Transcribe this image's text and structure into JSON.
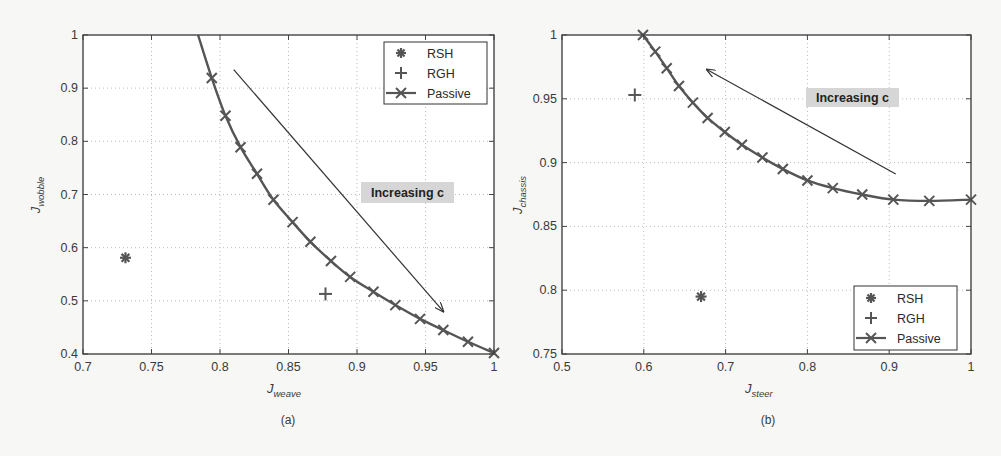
{
  "figure": {
    "panels": [
      {
        "caption": "(a)",
        "xlabel_main": "J",
        "xlabel_sub": "weave",
        "ylabel_main": "J",
        "ylabel_sub": "wobble",
        "annotation": "Increasing c",
        "legend": [
          "RSH",
          "RGH",
          "Passive"
        ]
      },
      {
        "caption": "(b)",
        "xlabel_main": "J",
        "xlabel_sub": "steer",
        "ylabel_main": "J",
        "ylabel_sub": "chassis",
        "annotation": "Increasing c",
        "legend": [
          "RSH",
          "RGH",
          "Passive"
        ]
      }
    ]
  },
  "colors": {
    "curve": "#555555",
    "axes": "#444444",
    "grid": "#bbbbbb",
    "annotation_bg": "#d6d6d6",
    "background": "#f7f7f5"
  },
  "chart_data": [
    {
      "type": "scatter",
      "title": "(a)",
      "xlabel": "J_weave",
      "ylabel": "J_wobble",
      "xlim": [
        0.7,
        1.0
      ],
      "ylim": [
        0.4,
        1.0
      ],
      "xticks": [
        0.7,
        0.75,
        0.8,
        0.85,
        0.9,
        0.95,
        1.0
      ],
      "xtick_labels": [
        "0.7",
        "0.75",
        "0.8",
        "0.85",
        "0.9",
        "0.95",
        "1"
      ],
      "yticks": [
        0.4,
        0.5,
        0.6,
        0.7,
        0.8,
        0.9,
        1.0
      ],
      "ytick_labels": [
        "0.4",
        "0.5",
        "0.6",
        "0.7",
        "0.8",
        "0.9",
        "1"
      ],
      "grid": true,
      "legend_position": "upper right",
      "annotation": {
        "text": "Increasing c",
        "arrow_from": [
          0.81,
          0.935
        ],
        "arrow_to": [
          0.963,
          0.48
        ]
      },
      "series": [
        {
          "name": "RSH",
          "marker": "asterisk",
          "x": [
            0.731
          ],
          "y": [
            0.581
          ]
        },
        {
          "name": "RGH",
          "marker": "plus",
          "x": [
            0.877
          ],
          "y": [
            0.513
          ]
        },
        {
          "name": "Passive",
          "marker": "x-line",
          "curve_start": [
            0.784,
            1.0
          ],
          "x": [
            0.794,
            0.804,
            0.815,
            0.827,
            0.839,
            0.853,
            0.866,
            0.881,
            0.895,
            0.912,
            0.928,
            0.946,
            0.963,
            0.981,
            1.0
          ],
          "y": [
            0.919,
            0.848,
            0.789,
            0.739,
            0.69,
            0.648,
            0.611,
            0.575,
            0.545,
            0.517,
            0.492,
            0.466,
            0.445,
            0.423,
            0.402
          ]
        }
      ]
    },
    {
      "type": "scatter",
      "title": "(b)",
      "xlabel": "J_steer",
      "ylabel": "J_chassis",
      "xlim": [
        0.5,
        1.0
      ],
      "ylim": [
        0.75,
        1.0
      ],
      "xticks": [
        0.5,
        0.6,
        0.7,
        0.8,
        0.9,
        1.0
      ],
      "xtick_labels": [
        "0.5",
        "0.6",
        "0.7",
        "0.8",
        "0.9",
        "1"
      ],
      "yticks": [
        0.75,
        0.8,
        0.85,
        0.9,
        0.95,
        1.0
      ],
      "ytick_labels": [
        "0.75",
        "0.8",
        "0.85",
        "0.9",
        "0.95",
        "1"
      ],
      "grid": true,
      "legend_position": "lower right",
      "annotation": {
        "text": "Increasing c",
        "arrow_from": [
          0.908,
          0.891
        ],
        "arrow_to": [
          0.677,
          0.973
        ]
      },
      "series": [
        {
          "name": "RSH",
          "marker": "asterisk",
          "x": [
            0.67
          ],
          "y": [
            0.795
          ]
        },
        {
          "name": "RGH",
          "marker": "plus",
          "x": [
            0.589
          ],
          "y": [
            0.953
          ]
        },
        {
          "name": "Passive",
          "marker": "x-line",
          "x": [
            0.599,
            0.614,
            0.628,
            0.643,
            0.66,
            0.678,
            0.699,
            0.72,
            0.745,
            0.77,
            0.8,
            0.831,
            0.867,
            0.905,
            0.949,
            1.0
          ],
          "y": [
            1.0,
            0.987,
            0.974,
            0.96,
            0.947,
            0.935,
            0.924,
            0.914,
            0.904,
            0.895,
            0.886,
            0.88,
            0.875,
            0.871,
            0.87,
            0.871
          ]
        }
      ]
    }
  ]
}
